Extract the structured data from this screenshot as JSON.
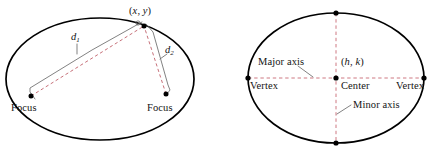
{
  "figure": {
    "colors": {
      "outline": "#000000",
      "dashed_distance": "#c0606a",
      "dashed_axis": "#c86a74",
      "leader": "#6e6e6e",
      "point": "#000000",
      "background": "#ffffff",
      "text": "#141414"
    }
  },
  "left_figure": {
    "name": "focus-definition-ellipse",
    "point_label": {
      "open": "(",
      "x": "x",
      "comma": ", ",
      "y": "y",
      "close": ")",
      "full": "(x, y)"
    },
    "distance_labels": [
      {
        "symbol": "d",
        "subscript": "1",
        "full": "d1"
      },
      {
        "symbol": "d",
        "subscript": "2",
        "full": "d2"
      }
    ],
    "focus_left_label": "Focus",
    "focus_right_label": "Focus",
    "geometry": {
      "ellipse_cx": 100,
      "ellipse_cy": 79,
      "ellipse_rx": 94,
      "ellipse_ry": 61,
      "point_x": 144,
      "point_y": 26,
      "focus_left_x": 31,
      "focus_left_y": 96,
      "focus_right_x": 166,
      "focus_right_y": 94
    }
  },
  "right_figure": {
    "name": "parts-of-ellipse",
    "center_label": "Center",
    "center_coords": {
      "open": "(",
      "h": "h",
      "comma": ", ",
      "k": "k",
      "close": ")",
      "full": "(h, k)"
    },
    "vertex_left_label": "Vertex",
    "vertex_right_label": "Vertex",
    "major_axis_label": "Major axis",
    "minor_axis_label": "Minor axis",
    "geometry": {
      "ellipse_cx": 336,
      "ellipse_cy": 78,
      "ellipse_rx": 88,
      "ellipse_ry": 65,
      "vertex_left_x": 248,
      "vertex_right_x": 424,
      "co_vertex_top_y": 13,
      "co_vertex_bottom_y": 143
    }
  }
}
